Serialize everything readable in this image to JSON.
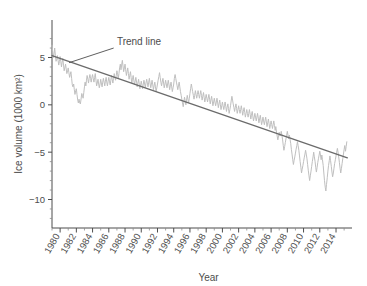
{
  "chart_data": {
    "type": "line",
    "title": "",
    "xlabel": "Year",
    "ylabel": "Ice volume (1000 km²)",
    "xlim": [
      1979,
      2015.6
    ],
    "ylim": [
      -12.5,
      7.5
    ],
    "grid": false,
    "legend": "none",
    "xticks": [
      1980,
      1982,
      1984,
      1986,
      1988,
      1990,
      1992,
      1994,
      1996,
      1998,
      2000,
      2002,
      2004,
      2006,
      2008,
      2010,
      2012,
      2014
    ],
    "xtick_labels": [
      "1980",
      "1982",
      "1984",
      "1986",
      "1988",
      "1990",
      "1992",
      "1994",
      "1996",
      "1998",
      "2000",
      "2002",
      "2004",
      "2006",
      "2008",
      "2010",
      "2012",
      "2014"
    ],
    "xtick_minor_step": 1,
    "yticks": [
      5,
      0,
      -5,
      -10
    ],
    "ytick_labels": [
      "5",
      "0",
      "−5",
      "−10"
    ],
    "ytick_minor_step": 1,
    "annotations": [
      {
        "text": "Trend line",
        "text_x": 1987.0,
        "text_y": 6.35,
        "leader_from_x": 1986.6,
        "leader_from_y": 6.0,
        "leader_to_x": 1981.1,
        "leader_to_y": 4.45
      }
    ],
    "series": [
      {
        "name": "Ice volume anomaly",
        "color": "#bfbfbf",
        "width": 1.0,
        "x": [
          1979.0,
          1979.08,
          1979.17,
          1979.25,
          1979.33,
          1979.42,
          1979.5,
          1979.58,
          1979.67,
          1979.75,
          1979.83,
          1979.92,
          1980.0,
          1980.08,
          1980.17,
          1980.25,
          1980.33,
          1980.42,
          1980.5,
          1980.58,
          1980.67,
          1980.75,
          1980.83,
          1980.92,
          1981.0,
          1981.08,
          1981.17,
          1981.25,
          1981.33,
          1981.42,
          1981.5,
          1981.58,
          1981.67,
          1981.75,
          1981.83,
          1981.92,
          1982.0,
          1982.08,
          1982.17,
          1982.25,
          1982.33,
          1982.42,
          1982.5,
          1982.58,
          1982.67,
          1982.75,
          1982.83,
          1982.92,
          1983.0,
          1983.08,
          1983.17,
          1983.25,
          1983.33,
          1983.42,
          1983.5,
          1983.58,
          1983.67,
          1983.75,
          1983.83,
          1983.92,
          1984.0,
          1984.08,
          1984.17,
          1984.25,
          1984.33,
          1984.42,
          1984.5,
          1984.58,
          1984.67,
          1984.75,
          1984.83,
          1984.92,
          1985.0,
          1985.08,
          1985.17,
          1985.25,
          1985.33,
          1985.42,
          1985.5,
          1985.58,
          1985.67,
          1985.75,
          1985.83,
          1985.92,
          1986.0,
          1986.08,
          1986.17,
          1986.25,
          1986.33,
          1986.42,
          1986.5,
          1986.58,
          1986.67,
          1986.75,
          1986.83,
          1986.92,
          1987.0,
          1987.08,
          1987.17,
          1987.25,
          1987.33,
          1987.42,
          1987.5,
          1987.58,
          1987.67,
          1987.75,
          1987.83,
          1987.92,
          1988.0,
          1988.08,
          1988.17,
          1988.25,
          1988.33,
          1988.42,
          1988.5,
          1988.58,
          1988.67,
          1988.75,
          1988.83,
          1988.92,
          1989.0,
          1989.08,
          1989.17,
          1989.25,
          1989.33,
          1989.42,
          1989.5,
          1989.58,
          1989.67,
          1989.75,
          1989.83,
          1989.92,
          1990.0,
          1990.08,
          1990.17,
          1990.25,
          1990.33,
          1990.42,
          1990.5,
          1990.58,
          1990.67,
          1990.75,
          1990.83,
          1990.92,
          1991.0,
          1991.08,
          1991.17,
          1991.25,
          1991.33,
          1991.42,
          1991.5,
          1991.58,
          1991.67,
          1991.75,
          1991.83,
          1991.92,
          1992.0,
          1992.08,
          1992.17,
          1992.25,
          1992.33,
          1992.42,
          1992.5,
          1992.58,
          1992.67,
          1992.75,
          1992.83,
          1992.92,
          1993.0,
          1993.08,
          1993.17,
          1993.25,
          1993.33,
          1993.42,
          1993.5,
          1993.58,
          1993.67,
          1993.75,
          1993.83,
          1993.92,
          1994.0,
          1994.08,
          1994.17,
          1994.25,
          1994.33,
          1994.42,
          1994.5,
          1994.58,
          1994.67,
          1994.75,
          1994.83,
          1994.92,
          1995.0,
          1995.08,
          1995.17,
          1995.25,
          1995.33,
          1995.42,
          1995.5,
          1995.58,
          1995.67,
          1995.75,
          1995.83,
          1995.92,
          1996.0,
          1996.08,
          1996.17,
          1996.25,
          1996.33,
          1996.42,
          1996.5,
          1996.58,
          1996.67,
          1996.75,
          1996.83,
          1996.92,
          1997.0,
          1997.08,
          1997.17,
          1997.25,
          1997.33,
          1997.42,
          1997.5,
          1997.58,
          1997.67,
          1997.75,
          1997.83,
          1997.92,
          1998.0,
          1998.08,
          1998.17,
          1998.25,
          1998.33,
          1998.42,
          1998.5,
          1998.58,
          1998.67,
          1998.75,
          1998.83,
          1998.92,
          1999.0,
          1999.08,
          1999.17,
          1999.25,
          1999.33,
          1999.42,
          1999.5,
          1999.58,
          1999.67,
          1999.75,
          1999.83,
          1999.92,
          2000.0,
          2000.08,
          2000.17,
          2000.25,
          2000.33,
          2000.42,
          2000.5,
          2000.58,
          2000.67,
          2000.75,
          2000.83,
          2000.92,
          2001.0,
          2001.08,
          2001.17,
          2001.25,
          2001.33,
          2001.42,
          2001.5,
          2001.58,
          2001.67,
          2001.75,
          2001.83,
          2001.92,
          2002.0,
          2002.08,
          2002.17,
          2002.25,
          2002.33,
          2002.42,
          2002.5,
          2002.58,
          2002.67,
          2002.75,
          2002.83,
          2002.92,
          2003.0,
          2003.08,
          2003.17,
          2003.25,
          2003.33,
          2003.42,
          2003.5,
          2003.58,
          2003.67,
          2003.75,
          2003.83,
          2003.92,
          2004.0,
          2004.08,
          2004.17,
          2004.25,
          2004.33,
          2004.42,
          2004.5,
          2004.58,
          2004.67,
          2004.75,
          2004.83,
          2004.92,
          2005.0,
          2005.08,
          2005.17,
          2005.25,
          2005.33,
          2005.42,
          2005.5,
          2005.58,
          2005.67,
          2005.75,
          2005.83,
          2005.92,
          2006.0,
          2006.08,
          2006.17,
          2006.25,
          2006.33,
          2006.42,
          2006.5,
          2006.58,
          2006.67,
          2006.75,
          2006.83,
          2006.92,
          2007.0,
          2007.08,
          2007.17,
          2007.25,
          2007.33,
          2007.42,
          2007.5,
          2007.58,
          2007.67,
          2007.75,
          2007.83,
          2007.92,
          2008.0,
          2008.08,
          2008.17,
          2008.25,
          2008.33,
          2008.42,
          2008.5,
          2008.58,
          2008.67,
          2008.75,
          2008.83,
          2008.92,
          2009.0,
          2009.08,
          2009.17,
          2009.25,
          2009.33,
          2009.42,
          2009.5,
          2009.58,
          2009.67,
          2009.75,
          2009.83,
          2009.92,
          2010.0,
          2010.08,
          2010.17,
          2010.25,
          2010.33,
          2010.42,
          2010.5,
          2010.58,
          2010.67,
          2010.75,
          2010.83,
          2010.92,
          2011.0,
          2011.08,
          2011.17,
          2011.25,
          2011.33,
          2011.42,
          2011.5,
          2011.58,
          2011.67,
          2011.75,
          2011.83,
          2011.92,
          2012.0,
          2012.08,
          2012.17,
          2012.25,
          2012.33,
          2012.42,
          2012.5,
          2012.58,
          2012.67,
          2012.75,
          2012.83,
          2012.92,
          2013.0,
          2013.08,
          2013.17,
          2013.25,
          2013.33,
          2013.42,
          2013.5,
          2013.58,
          2013.67,
          2013.75,
          2013.83,
          2013.92,
          2014.0,
          2014.08,
          2014.17,
          2014.25,
          2014.33,
          2014.42,
          2014.5,
          2014.58,
          2014.67,
          2014.75,
          2014.83,
          2014.92,
          2015.0,
          2015.08,
          2015.17,
          2015.25,
          2015.33
        ],
        "y": [
          6.3,
          5.6,
          5.0,
          5.4,
          6.0,
          5.2,
          4.6,
          4.8,
          5.2,
          4.7,
          4.2,
          4.6,
          5.1,
          4.6,
          4.0,
          4.5,
          4.9,
          4.2,
          3.6,
          3.9,
          4.3,
          3.8,
          3.3,
          3.6,
          3.9,
          3.4,
          2.9,
          3.2,
          3.5,
          2.8,
          2.1,
          1.9,
          2.2,
          1.6,
          1.1,
          1.5,
          1.7,
          1.1,
          0.5,
          0.2,
          0.6,
          0.2,
          0.1,
          0.6,
          1.2,
          1.0,
          0.7,
          1.3,
          1.9,
          2.4,
          2.0,
          2.6,
          3.1,
          2.7,
          2.3,
          2.8,
          3.2,
          2.8,
          2.4,
          2.9,
          3.2,
          2.8,
          2.4,
          2.9,
          3.3,
          2.6,
          2.0,
          2.3,
          2.7,
          2.2,
          1.8,
          2.2,
          2.7,
          2.3,
          1.9,
          2.4,
          2.8,
          2.4,
          2.0,
          2.5,
          2.9,
          2.4,
          2.0,
          2.5,
          2.9,
          2.5,
          2.1,
          2.6,
          3.1,
          2.7,
          2.3,
          2.8,
          3.3,
          2.9,
          2.6,
          3.1,
          3.6,
          3.2,
          2.8,
          3.3,
          3.9,
          4.3,
          3.7,
          4.2,
          4.7,
          4.1,
          3.5,
          3.9,
          4.3,
          3.7,
          3.1,
          3.5,
          3.9,
          3.3,
          2.7,
          3.1,
          3.5,
          2.9,
          2.3,
          2.7,
          3.1,
          2.6,
          2.1,
          2.5,
          2.9,
          2.4,
          1.9,
          2.3,
          2.7,
          2.2,
          1.7,
          2.1,
          2.5,
          2.1,
          1.7,
          2.2,
          2.6,
          2.2,
          1.8,
          2.3,
          2.7,
          2.3,
          1.9,
          2.4,
          2.8,
          2.3,
          1.8,
          2.2,
          2.6,
          2.1,
          1.6,
          2.0,
          2.4,
          1.9,
          1.4,
          1.8,
          2.2,
          2.6,
          3.0,
          3.4,
          2.9,
          2.4,
          2.0,
          2.4,
          2.8,
          2.3,
          1.8,
          2.2,
          2.6,
          2.2,
          1.8,
          2.2,
          2.6,
          2.1,
          1.6,
          2.0,
          2.4,
          1.9,
          1.4,
          1.8,
          2.2,
          2.8,
          3.2,
          2.8,
          2.4,
          2.0,
          1.6,
          2.0,
          2.4,
          1.9,
          1.4,
          1.0,
          0.6,
          0.2,
          -0.2,
          0.3,
          0.8,
          0.4,
          0.0,
          0.5,
          1.0,
          0.6,
          0.2,
          0.7,
          1.2,
          1.7,
          2.2,
          1.8,
          1.4,
          1.0,
          0.6,
          1.0,
          1.5,
          1.1,
          0.7,
          1.1,
          1.5,
          1.1,
          0.7,
          1.1,
          1.5,
          1.0,
          0.5,
          0.9,
          1.3,
          0.8,
          0.3,
          0.7,
          1.1,
          0.7,
          0.3,
          0.7,
          1.1,
          0.6,
          0.1,
          0.5,
          0.9,
          0.4,
          -0.1,
          0.3,
          0.7,
          0.3,
          -0.1,
          0.3,
          0.7,
          0.2,
          -0.3,
          0.1,
          0.5,
          0.0,
          -0.5,
          -0.1,
          0.3,
          -0.1,
          -0.5,
          -0.1,
          0.3,
          -0.2,
          -0.7,
          -0.3,
          0.1,
          -0.4,
          -0.9,
          -0.5,
          -0.1,
          0.4,
          0.9,
          0.5,
          0.1,
          -0.3,
          -0.7,
          -0.3,
          0.1,
          -0.4,
          -0.9,
          -0.5,
          -0.1,
          -0.5,
          -0.9,
          -0.5,
          -0.1,
          -0.6,
          -1.1,
          -0.7,
          -0.3,
          -0.8,
          -1.3,
          -0.9,
          -0.5,
          -0.9,
          -1.3,
          -0.9,
          -0.5,
          -1.0,
          -1.5,
          -1.1,
          -0.7,
          -1.2,
          -1.7,
          -1.3,
          -0.9,
          -1.3,
          -1.7,
          -1.3,
          -0.9,
          -1.4,
          -1.9,
          -1.5,
          -1.1,
          -1.6,
          -2.1,
          -1.7,
          -1.3,
          -1.7,
          -2.1,
          -1.7,
          -1.3,
          -1.8,
          -2.3,
          -1.9,
          -1.5,
          -2.0,
          -2.5,
          -2.1,
          -1.7,
          -2.1,
          -2.5,
          -2.1,
          -1.7,
          -2.2,
          -2.7,
          -2.3,
          -2.9,
          -3.3,
          -3.7,
          -3.3,
          -2.9,
          -3.3,
          -3.2,
          -2.8,
          -3.2,
          -3.7,
          -4.3,
          -4.8,
          -4.4,
          -4.0,
          -3.6,
          -3.2,
          -2.8,
          -3.2,
          -3.6,
          -3.2,
          -3.6,
          -4.1,
          -4.7,
          -5.2,
          -5.8,
          -6.3,
          -5.9,
          -5.5,
          -5.1,
          -4.7,
          -4.3,
          -3.9,
          -4.3,
          -4.8,
          -5.4,
          -6.0,
          -6.6,
          -7.2,
          -6.8,
          -6.4,
          -6.0,
          -5.6,
          -5.2,
          -4.8,
          -5.2,
          -5.7,
          -6.3,
          -6.9,
          -7.5,
          -8.0,
          -7.5,
          -7.0,
          -6.5,
          -6.0,
          -5.5,
          -5.0,
          -5.5,
          -6.0,
          -6.6,
          -7.1,
          -6.6,
          -6.1,
          -5.7,
          -5.3,
          -4.9,
          -5.3,
          -5.8,
          -5.3,
          -5.8,
          -6.4,
          -7.2,
          -8.0,
          -8.7,
          -9.1,
          -8.4,
          -7.7,
          -7.0,
          -6.4,
          -5.9,
          -5.4,
          -5.9,
          -6.5,
          -7.1,
          -7.6,
          -7.2,
          -6.7,
          -6.2,
          -5.8,
          -5.4,
          -5.0,
          -4.6,
          -5.0,
          -5.5,
          -6.1,
          -6.7,
          -7.2,
          -6.7,
          -6.2,
          -5.7,
          -5.2,
          -4.7,
          -4.3,
          -4.9,
          -4.4,
          -3.9
        ]
      }
    ],
    "trend": {
      "name": "Trend line",
      "color": "#6b6b6b",
      "width": 1.3,
      "x_start": 1979.0,
      "y_start": 5.2,
      "x_end": 2015.4,
      "y_end": -5.6
    }
  }
}
